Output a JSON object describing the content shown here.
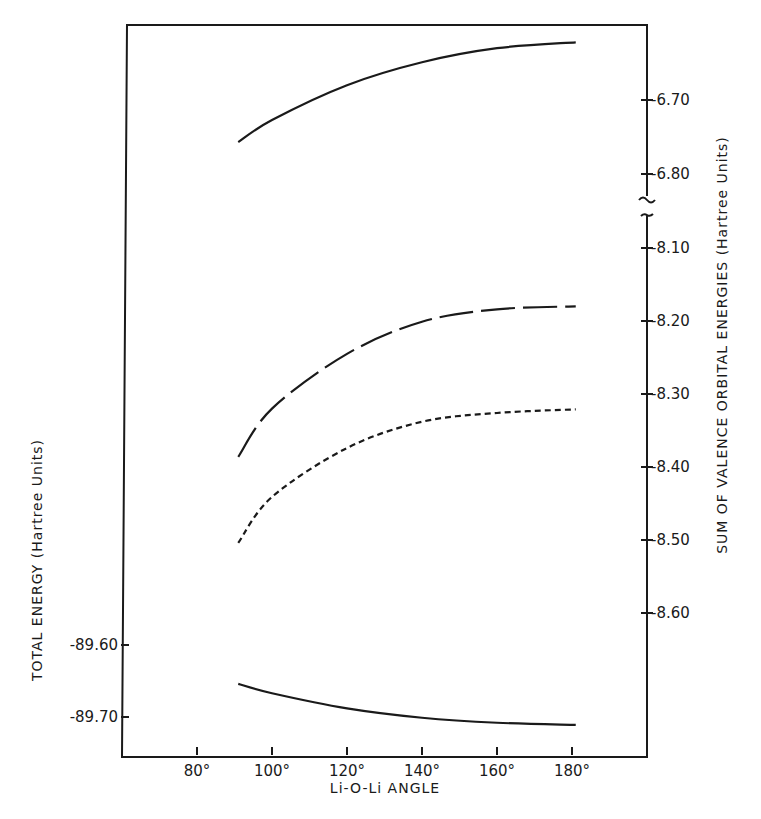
{
  "chart_data": {
    "type": "line",
    "title": "",
    "xlabel": "Li-O-Li ANGLE",
    "ylabel_left": "TOTAL ENERGY (Hartree Units)",
    "ylabel_right": "SUM OF VALENCE ORBITAL ENERGIES (Hartree Units)",
    "x_ticks": [
      "80°",
      "100°",
      "120°",
      "140°",
      "160°",
      "180°"
    ],
    "x_tick_values": [
      80,
      100,
      120,
      140,
      160,
      180
    ],
    "xlim": [
      69,
      197
    ],
    "left_y_ticks": [
      "-89.60",
      "-89.70"
    ],
    "left_y_tick_values": [
      -89.6,
      -89.7
    ],
    "right_y_ticks_upper": [
      "-6.70",
      "-6.80"
    ],
    "right_y_tick_values_upper": [
      -6.7,
      -6.8
    ],
    "right_y_ticks_lower": [
      "-8.10",
      "-8.20",
      "-8.30",
      "-8.40",
      "-8.50",
      "-8.60"
    ],
    "right_y_tick_values_lower": [
      -8.1,
      -8.2,
      -8.3,
      -8.4,
      -8.5,
      -8.6
    ],
    "right_axis_break": true,
    "grid": false,
    "legend": "none",
    "x": [
      91,
      100,
      120,
      140,
      160,
      181
    ],
    "series": [
      {
        "name": "upper solid (right axis, -6.7 range)",
        "style": "solid",
        "axis": "right-upper",
        "values": [
          -6.757,
          -6.727,
          -6.68,
          -6.649,
          -6.63,
          -6.622
        ]
      },
      {
        "name": "long dashed (right axis, -8.2 range)",
        "style": "long-dash",
        "axis": "right-lower",
        "values": [
          -8.386,
          -8.32,
          -8.245,
          -8.201,
          -8.184,
          -8.18
        ]
      },
      {
        "name": "short dashed (right axis, -8.3 range)",
        "style": "short-dash",
        "axis": "right-lower",
        "values": [
          -8.504,
          -8.441,
          -8.374,
          -8.338,
          -8.326,
          -8.321
        ]
      },
      {
        "name": "lower solid (left axis, total energy)",
        "style": "solid",
        "axis": "left",
        "values": [
          -89.654,
          -89.667,
          -89.688,
          -89.701,
          -89.708,
          -89.711
        ]
      }
    ]
  }
}
